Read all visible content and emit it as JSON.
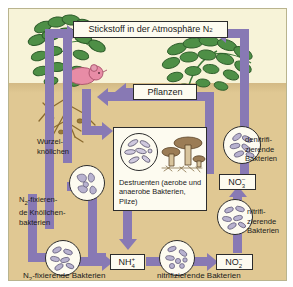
{
  "diagram": {
    "colors": {
      "arrow": "#8879b4",
      "sky": "#f7f3d8",
      "soil": "#e0c893",
      "box_fill": "#fdfbf0",
      "ink": "#1a1a1a",
      "plant_green": "#3f7a3a",
      "mouse_pink": "#e88ca6",
      "root_brown": "#8a6a2f"
    },
    "boxes": {
      "atmosphere": "Stickstoff in der Atmosphäre N2",
      "atmosphere_main": "Stickstoff in der Atmosphäre N",
      "atmosphere_sub": "2",
      "plants": "Pflanzen",
      "ammonium_main": "NH",
      "ammonium_sub": "4",
      "ammonium_sup": "+",
      "nitrite_main": "NO",
      "nitrite_sub": "2",
      "nitrite_sup": "–",
      "nitrate_main": "NO",
      "nitrate_sub": "3",
      "nitrate_sup": "–",
      "destruents": "Destruenten (aerobe und anaerobe Bakterien, Pilze)"
    },
    "captions": {
      "root_nodules": "Wurzel-\nknöllchen",
      "nodule_bacteria_l1": "N",
      "nodule_bacteria_sub": "2",
      "nodule_bacteria_l1b": "-fixieren-",
      "nodule_bacteria_l2": "de Knöllchen-",
      "nodule_bacteria_l3": "bakterien",
      "n2_fixing_bacteria_pre": "N",
      "n2_fixing_bacteria_sub": "2",
      "n2_fixing_bacteria_post": "-fixierende Bakterien",
      "nitrifying_bacteria_bottom": "nitrifizierende Bakterien",
      "denitrifying_bacteria": "denitrifi-\nzierende\nBakterien",
      "nitrifying_bacteria_right": "nitrifi-\nzierende\nBakterien"
    },
    "icons": {
      "legume_plant": "legume-plant-icon",
      "leafy_plant": "leafy-plant-icon",
      "mouse": "mouse-icon",
      "roots": "root-system-icon",
      "mushrooms": "mushroom-icon",
      "bacteria": "bacteria-colony-icon"
    }
  }
}
